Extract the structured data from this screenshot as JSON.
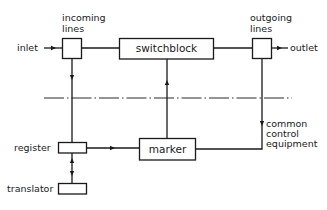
{
  "diagram": {
    "type": "block-diagram",
    "labels": {
      "inlet": "inlet",
      "outlet": "outlet",
      "incoming_lines_1": "incoming",
      "incoming_lines_2": "lines",
      "outgoing_lines_1": "outgoing",
      "outgoing_lines_2": "lines",
      "switchblock": "switchblock",
      "marker": "marker",
      "register": "register",
      "translator": "translator",
      "common_control_1": "common",
      "common_control_2": "control",
      "common_control_3": "equipment"
    },
    "nodes": [
      {
        "id": "incoming-lines",
        "label": "incoming lines"
      },
      {
        "id": "switchblock",
        "label": "switchblock"
      },
      {
        "id": "outgoing-lines",
        "label": "outgoing lines"
      },
      {
        "id": "marker",
        "label": "marker"
      },
      {
        "id": "register",
        "label": "register"
      },
      {
        "id": "translator",
        "label": "translator"
      }
    ],
    "edges": [
      {
        "from": "inlet",
        "to": "incoming-lines",
        "arrow": true
      },
      {
        "from": "incoming-lines",
        "to": "switchblock",
        "arrow": false
      },
      {
        "from": "switchblock",
        "to": "outgoing-lines",
        "arrow": false
      },
      {
        "from": "outgoing-lines",
        "to": "outlet",
        "arrow": true
      },
      {
        "from": "incoming-lines",
        "to": "register",
        "arrow": true
      },
      {
        "from": "register",
        "to": "marker",
        "arrow": true
      },
      {
        "from": "marker",
        "to": "switchblock",
        "arrow": true
      },
      {
        "from": "outgoing-lines",
        "to": "marker",
        "arrow": true,
        "label": "common control equipment"
      },
      {
        "from": "translator",
        "to": "register",
        "arrow": true,
        "bidirectional": true
      }
    ],
    "divider": "dash-dot line separating switching network from common control equipment"
  }
}
